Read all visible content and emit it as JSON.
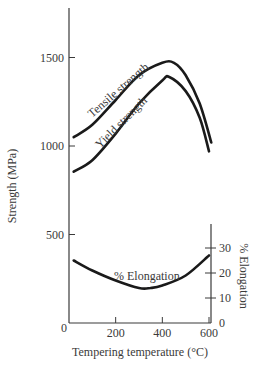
{
  "chart_data": {
    "type": "line",
    "title": "",
    "xlabel": "Tempering temperature (°C)",
    "ylabel": "Strength (MPa)",
    "y2label": "% Elongation",
    "xlim": [
      0,
      600
    ],
    "ylim": [
      0,
      1800
    ],
    "y2lim": [
      0,
      38
    ],
    "x_ticks": [
      0,
      200,
      400,
      600
    ],
    "y_ticks": [
      500,
      1000,
      1500
    ],
    "y_zero_label": "0",
    "y2_ticks": [
      0,
      10,
      20,
      30
    ],
    "grid": false,
    "legend": "inline curve labels",
    "series": [
      {
        "name": "Tensile strength",
        "axis": "left",
        "x": [
          20,
          100,
          200,
          300,
          400,
          450,
          500,
          560,
          610
        ],
        "y": [
          1050,
          1120,
          1260,
          1400,
          1470,
          1470,
          1400,
          1240,
          1020
        ]
      },
      {
        "name": "Yield strength",
        "axis": "left",
        "x": [
          20,
          100,
          200,
          300,
          400,
          430,
          500,
          560,
          600
        ],
        "y": [
          855,
          920,
          1070,
          1240,
          1370,
          1390,
          1310,
          1160,
          970
        ]
      },
      {
        "name": "% Elongation",
        "axis": "right",
        "x": [
          20,
          100,
          200,
          300,
          350,
          400,
          500,
          600
        ],
        "y": [
          25,
          21,
          17,
          14,
          14,
          15,
          19,
          27
        ]
      }
    ],
    "annotations": [
      "Tensile strength",
      "Yield strength",
      "% Elongation"
    ]
  }
}
